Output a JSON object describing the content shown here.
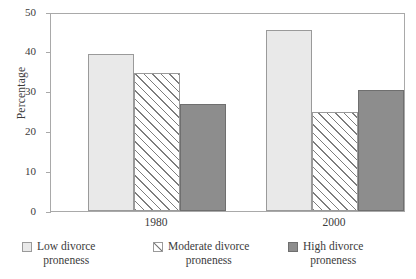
{
  "chart_data": {
    "type": "bar",
    "title": "",
    "xlabel": "",
    "ylabel": "Percentage",
    "ylim": [
      0,
      50
    ],
    "yticks": [
      0,
      10,
      20,
      30,
      40,
      50
    ],
    "ytick_labels": [
      "0",
      "10",
      "20",
      "30",
      "40",
      "50"
    ],
    "grid": false,
    "legend_position": "bottom",
    "categories": [
      "1980",
      "2000"
    ],
    "series": [
      {
        "name": "Low divorce proneness",
        "name_line1": "Low divorce",
        "name_line2": "proneness",
        "fill": "#e9e9e9",
        "pattern": "solid-light",
        "values": [
          39.5,
          45.6
        ]
      },
      {
        "name": "Moderate divorce proneness",
        "name_line1": "Moderate divorce",
        "name_line2": "proneness",
        "fill": "#ffffff",
        "pattern": "diagonal-hatch",
        "values": [
          34.8,
          24.8
        ]
      },
      {
        "name": "High divorce proneness",
        "name_line1": "High divorce",
        "name_line2": "proneness",
        "fill": "#8d8d8d",
        "pattern": "solid-dark",
        "values": [
          26.8,
          30.3
        ]
      }
    ]
  }
}
